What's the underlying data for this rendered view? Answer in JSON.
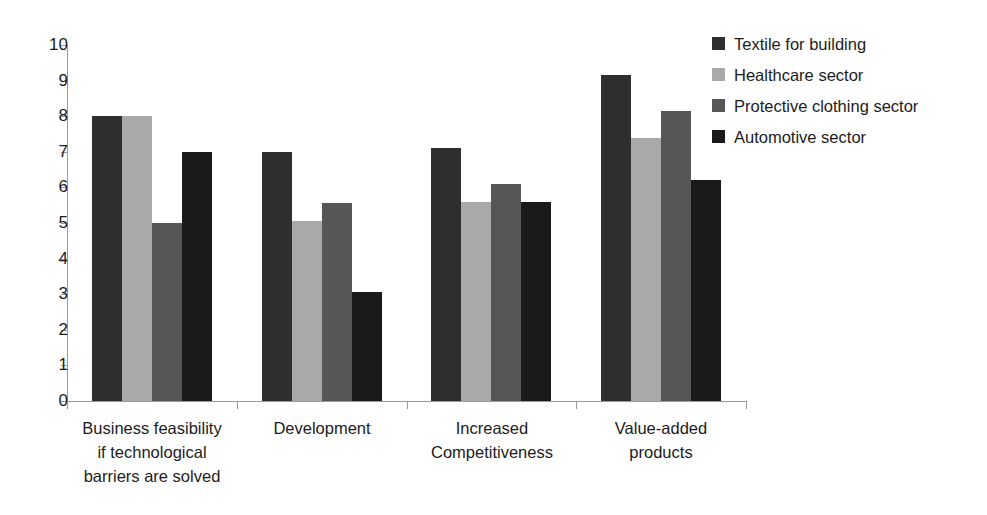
{
  "chart_data": {
    "type": "bar",
    "title": "",
    "subtitle": "",
    "xlabel": "",
    "ylabel": "",
    "ylim": [
      0,
      10
    ],
    "ytick_labels": [
      "10",
      "9",
      "8",
      "7",
      "6",
      "5",
      "4",
      "3",
      "2",
      "1",
      "0"
    ],
    "yticks": [
      10,
      9,
      8,
      7,
      6,
      5,
      4,
      3,
      2,
      1,
      0
    ],
    "grid": false,
    "legend_position": "right",
    "categories": [
      "Business feasibility if technological barriers are solved",
      "Development",
      "Increased Competitiveness",
      "Value-added products"
    ],
    "category_lines": [
      [
        "Business feasibility",
        "if technological",
        "barriers are solved"
      ],
      [
        "Development"
      ],
      [
        "Increased",
        "Competitiveness"
      ],
      [
        "Value-added",
        "products"
      ]
    ],
    "series": [
      {
        "name": "Textile for building",
        "color": "#2e2e2e",
        "values": [
          8.0,
          7.0,
          7.1,
          9.15
        ]
      },
      {
        "name": "Healthcare sector",
        "color": "#a9a9a9",
        "values": [
          8.0,
          5.05,
          5.6,
          7.4
        ]
      },
      {
        "name": "Protective clothing sector",
        "color": "#565656",
        "values": [
          5.0,
          5.55,
          6.1,
          8.15
        ]
      },
      {
        "name": "Automotive sector",
        "color": "#1a1a1a",
        "values": [
          7.0,
          3.05,
          5.6,
          6.2
        ]
      }
    ],
    "axis_color": "#9a9a9a",
    "text_color": "#1c1c1c",
    "background": "#ffffff"
  }
}
